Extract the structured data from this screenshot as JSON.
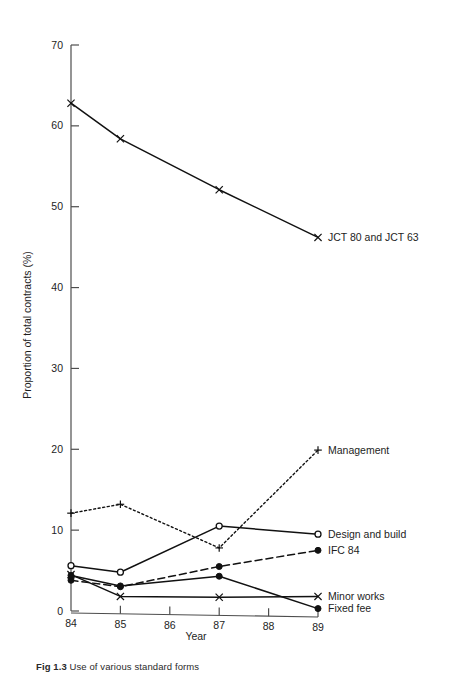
{
  "figure": {
    "caption_number": "Fig 1.3",
    "caption_text": "Use of various standard forms"
  },
  "chart_data": {
    "type": "line",
    "title": "",
    "xlabel": "Year",
    "ylabel": "Proportion of total contracts (%)",
    "x": [
      84,
      85,
      86,
      87,
      88,
      89
    ],
    "categories": [
      "84",
      "85",
      "86",
      "87",
      "88",
      "89"
    ],
    "xtick_labels": [
      "84",
      "85",
      "86",
      "87",
      "88",
      "89"
    ],
    "ytick_labels": [
      "0",
      "10",
      "20",
      "30",
      "40",
      "50",
      "60",
      "70"
    ],
    "ytick_values": [
      0,
      10,
      20,
      30,
      40,
      50,
      60,
      70
    ],
    "xlim": [
      84,
      89
    ],
    "ylim": [
      0,
      70
    ],
    "grid": false,
    "legend_position": "right-inline-labels",
    "series": [
      {
        "name": "JCT 80 and JCT 63",
        "label": "JCT 80 and JCT 63",
        "marker": "x",
        "linestyle": "solid",
        "color": "#111111",
        "x": [
          84,
          85,
          87,
          89
        ],
        "values": [
          62.8,
          58.4,
          52.1,
          46.2
        ]
      },
      {
        "name": "Management",
        "label": "Management",
        "marker": "plus",
        "linestyle": "dotted",
        "color": "#111111",
        "x": [
          84,
          85,
          87,
          89
        ],
        "values": [
          12.1,
          13.2,
          7.8,
          19.9
        ]
      },
      {
        "name": "Design and build",
        "label": "Design and build",
        "marker": "open-circle",
        "linestyle": "solid",
        "color": "#111111",
        "x": [
          84,
          85,
          87,
          89
        ],
        "values": [
          5.6,
          4.8,
          10.5,
          9.5
        ]
      },
      {
        "name": "IFC 84",
        "label": "IFC 84",
        "marker": "filled-circle",
        "linestyle": "dashed",
        "color": "#111111",
        "x": [
          84,
          85,
          87,
          89
        ],
        "values": [
          3.8,
          3.0,
          5.5,
          7.5
        ]
      },
      {
        "name": "Minor works",
        "label": "Minor works",
        "marker": "x",
        "linestyle": "solid",
        "color": "#111111",
        "x": [
          84,
          85,
          87,
          89
        ],
        "values": [
          4.5,
          1.8,
          1.7,
          1.8
        ]
      },
      {
        "name": "Fixed fee",
        "label": "Fixed fee",
        "marker": "filled-circle",
        "linestyle": "solid",
        "color": "#111111",
        "x": [
          84,
          85,
          87,
          89
        ],
        "values": [
          4.4,
          3.1,
          4.3,
          0.3
        ]
      }
    ]
  }
}
